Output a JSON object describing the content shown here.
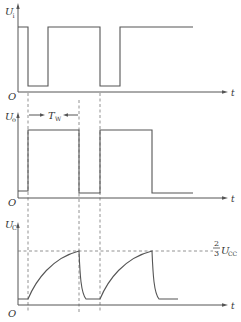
{
  "diagram": {
    "title": "",
    "panels": [
      {
        "id": "ui",
        "y_label": "U",
        "y_label_sub": "i",
        "origin_label": "O",
        "x_label": "t",
        "description": "Input trigger pulse train: high with two negative-going low pulses"
      },
      {
        "id": "uo",
        "y_label": "U",
        "y_label_sub": "o",
        "origin_label": "",
        "x_label": "t",
        "pulse_width_label": "T",
        "pulse_width_sub": "W",
        "description": "Output: two positive pulses of width T_W triggered by falling edges of U_i"
      },
      {
        "id": "uc",
        "y_label": "U",
        "y_label_sub": "C",
        "origin_label": "O",
        "x_label": "t",
        "threshold_label_num": "2",
        "threshold_label_den": "3",
        "threshold_label_var": "U",
        "threshold_label_sub": "CC",
        "description": "Capacitor voltage charges exponentially to 2/3 Ucc then discharges rapidly"
      }
    ],
    "guides": {
      "vertical_dashed_x": [
        28,
        79,
        100
      ],
      "threshold_dashed": "2/3 Ucc"
    },
    "colors": {
      "line": "#555555",
      "dash": "#777777",
      "text": "#333333",
      "background": "#ffffff"
    }
  }
}
